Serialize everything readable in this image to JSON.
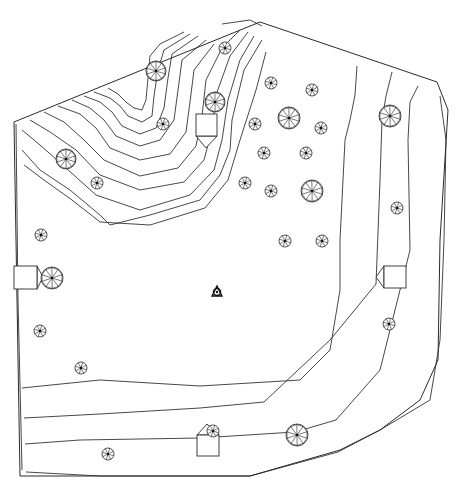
{
  "diagram": {
    "type": "site-plan-topographic",
    "width": 460,
    "height": 484,
    "colors": {
      "background": "#ffffff",
      "line": "#333333"
    },
    "boundary": [
      [
        14,
        122
      ],
      [
        260,
        22
      ],
      [
        437,
        82
      ],
      [
        448,
        110
      ],
      [
        440,
        240
      ],
      [
        438,
        360
      ],
      [
        420,
        400
      ],
      [
        380,
        430
      ],
      [
        340,
        450
      ],
      [
        250,
        476
      ],
      [
        20,
        476
      ]
    ],
    "contours": [
      [
        [
          16,
          124
        ],
        [
          18,
          300
        ],
        [
          22,
          470
        ]
      ],
      [
        [
          22,
          150
        ],
        [
          40,
          170
        ],
        [
          70,
          190
        ],
        [
          100,
          215
        ],
        [
          110,
          225
        ],
        [
          150,
          215
        ],
        [
          200,
          200
        ],
        [
          220,
          175
        ],
        [
          230,
          150
        ],
        [
          232,
          120
        ],
        [
          244,
          70
        ],
        [
          262,
          40
        ]
      ],
      [
        [
          24,
          165
        ],
        [
          44,
          180
        ],
        [
          72,
          200
        ],
        [
          100,
          222
        ],
        [
          150,
          225
        ],
        [
          205,
          208
        ],
        [
          228,
          180
        ],
        [
          240,
          140
        ],
        [
          256,
          90
        ],
        [
          266,
          52
        ]
      ],
      [
        [
          22,
          130
        ],
        [
          40,
          145
        ],
        [
          66,
          168
        ],
        [
          96,
          195
        ],
        [
          140,
          210
        ],
        [
          190,
          195
        ],
        [
          214,
          170
        ],
        [
          222,
          140
        ],
        [
          228,
          100
        ],
        [
          240,
          60
        ],
        [
          254,
          36
        ]
      ],
      [
        [
          30,
          120
        ],
        [
          50,
          132
        ],
        [
          76,
          150
        ],
        [
          100,
          175
        ],
        [
          140,
          190
        ],
        [
          184,
          182
        ],
        [
          204,
          160
        ],
        [
          212,
          130
        ],
        [
          216,
          95
        ],
        [
          230,
          56
        ],
        [
          248,
          32
        ]
      ],
      [
        [
          44,
          112
        ],
        [
          64,
          122
        ],
        [
          84,
          140
        ],
        [
          104,
          160
        ],
        [
          140,
          176
        ],
        [
          178,
          168
        ],
        [
          196,
          146
        ],
        [
          202,
          116
        ],
        [
          206,
          80
        ],
        [
          222,
          48
        ],
        [
          240,
          30
        ]
      ],
      [
        [
          58,
          106
        ],
        [
          80,
          114
        ],
        [
          96,
          128
        ],
        [
          110,
          148
        ],
        [
          140,
          160
        ],
        [
          170,
          154
        ],
        [
          186,
          132
        ],
        [
          190,
          102
        ],
        [
          194,
          70
        ],
        [
          214,
          44
        ]
      ],
      [
        [
          72,
          100
        ],
        [
          90,
          108
        ],
        [
          104,
          120
        ],
        [
          116,
          136
        ],
        [
          140,
          146
        ],
        [
          160,
          140
        ],
        [
          174,
          120
        ],
        [
          178,
          90
        ],
        [
          182,
          60
        ],
        [
          206,
          40
        ]
      ],
      [
        [
          84,
          96
        ],
        [
          100,
          102
        ],
        [
          112,
          112
        ],
        [
          122,
          126
        ],
        [
          140,
          134
        ],
        [
          156,
          128
        ],
        [
          164,
          108
        ],
        [
          168,
          78
        ],
        [
          172,
          54
        ],
        [
          198,
          36
        ]
      ],
      [
        [
          94,
          92
        ],
        [
          110,
          98
        ],
        [
          120,
          106
        ],
        [
          128,
          116
        ],
        [
          142,
          122
        ],
        [
          152,
          116
        ],
        [
          154,
          96
        ],
        [
          158,
          70
        ],
        [
          164,
          50
        ],
        [
          190,
          34
        ]
      ],
      [
        [
          108,
          88
        ],
        [
          118,
          94
        ],
        [
          126,
          102
        ],
        [
          134,
          108
        ],
        [
          142,
          110
        ],
        [
          146,
          100
        ],
        [
          148,
          78
        ],
        [
          150,
          56
        ],
        [
          160,
          44
        ],
        [
          184,
          32
        ]
      ],
      [
        [
          222,
          24
        ],
        [
          250,
          20
        ],
        [
          262,
          26
        ]
      ],
      [
        [
          22,
          388
        ],
        [
          100,
          380
        ],
        [
          200,
          386
        ],
        [
          300,
          380
        ],
        [
          330,
          350
        ],
        [
          340,
          290
        ],
        [
          340,
          240
        ],
        [
          345,
          140
        ],
        [
          350,
          120
        ],
        [
          355,
          95
        ],
        [
          357,
          66
        ]
      ],
      [
        [
          24,
          418
        ],
        [
          100,
          414
        ],
        [
          200,
          408
        ],
        [
          264,
          402
        ],
        [
          330,
          340
        ],
        [
          376,
          284
        ],
        [
          380,
          180
        ],
        [
          382,
          120
        ],
        [
          386,
          96
        ],
        [
          392,
          72
        ]
      ],
      [
        [
          25,
          444
        ],
        [
          80,
          440
        ],
        [
          200,
          438
        ],
        [
          295,
          432
        ],
        [
          336,
          420
        ],
        [
          380,
          370
        ],
        [
          390,
          330
        ],
        [
          410,
          250
        ],
        [
          408,
          140
        ],
        [
          410,
          102
        ],
        [
          418,
          86
        ]
      ],
      [
        [
          26,
          472
        ],
        [
          100,
          476
        ],
        [
          250,
          476
        ],
        [
          338,
          452
        ],
        [
          380,
          430
        ],
        [
          430,
          400
        ],
        [
          440,
          340
        ],
        [
          444,
          240
        ],
        [
          446,
          140
        ],
        [
          440,
          96
        ]
      ]
    ],
    "trees": [
      {
        "x": 156,
        "y": 71,
        "r": 10,
        "spokes": 10,
        "kind": "large"
      },
      {
        "x": 225,
        "y": 48,
        "r": 6,
        "spokes": 8,
        "kind": "small"
      },
      {
        "x": 215,
        "y": 102,
        "r": 10,
        "spokes": 10,
        "kind": "large"
      },
      {
        "x": 163,
        "y": 124,
        "r": 6,
        "spokes": 8,
        "kind": "small"
      },
      {
        "x": 66,
        "y": 159,
        "r": 10,
        "spokes": 10,
        "kind": "large"
      },
      {
        "x": 97,
        "y": 183,
        "r": 6,
        "spokes": 8,
        "kind": "small"
      },
      {
        "x": 41,
        "y": 235,
        "r": 6,
        "spokes": 8,
        "kind": "small"
      },
      {
        "x": 271,
        "y": 83,
        "r": 6,
        "spokes": 8,
        "kind": "small"
      },
      {
        "x": 312,
        "y": 90,
        "r": 6,
        "spokes": 8,
        "kind": "small"
      },
      {
        "x": 289,
        "y": 118,
        "r": 11,
        "spokes": 10,
        "kind": "large"
      },
      {
        "x": 255,
        "y": 124,
        "r": 6,
        "spokes": 8,
        "kind": "small"
      },
      {
        "x": 321,
        "y": 128,
        "r": 6,
        "spokes": 8,
        "kind": "small"
      },
      {
        "x": 264,
        "y": 153,
        "r": 6,
        "spokes": 8,
        "kind": "small"
      },
      {
        "x": 306,
        "y": 153,
        "r": 6,
        "spokes": 8,
        "kind": "small"
      },
      {
        "x": 245,
        "y": 183,
        "r": 6,
        "spokes": 8,
        "kind": "small"
      },
      {
        "x": 271,
        "y": 191,
        "r": 6,
        "spokes": 8,
        "kind": "small"
      },
      {
        "x": 312,
        "y": 191,
        "r": 11,
        "spokes": 10,
        "kind": "large"
      },
      {
        "x": 390,
        "y": 116,
        "r": 11,
        "spokes": 10,
        "kind": "large"
      },
      {
        "x": 397,
        "y": 208,
        "r": 6,
        "spokes": 8,
        "kind": "small"
      },
      {
        "x": 285,
        "y": 241,
        "r": 6,
        "spokes": 8,
        "kind": "small"
      },
      {
        "x": 322,
        "y": 241,
        "r": 6,
        "spokes": 8,
        "kind": "small"
      },
      {
        "x": 52,
        "y": 278,
        "r": 11,
        "spokes": 10,
        "kind": "large"
      },
      {
        "x": 40,
        "y": 331,
        "r": 6,
        "spokes": 8,
        "kind": "small"
      },
      {
        "x": 81,
        "y": 368,
        "r": 6,
        "spokes": 8,
        "kind": "small"
      },
      {
        "x": 389,
        "y": 324,
        "r": 6,
        "spokes": 8,
        "kind": "small"
      },
      {
        "x": 213,
        "y": 431,
        "r": 6,
        "spokes": 8,
        "kind": "small"
      },
      {
        "x": 297,
        "y": 435,
        "r": 11,
        "spokes": 10,
        "kind": "large"
      },
      {
        "x": 108,
        "y": 454,
        "r": 6,
        "spokes": 8,
        "kind": "small"
      }
    ],
    "structures": [
      {
        "name": "structure-top-center",
        "rect": [
          196,
          114,
          21,
          22
        ],
        "arrow": [
          [
            196,
            136
          ],
          [
            206,
            148
          ],
          [
            217,
            136
          ]
        ]
      },
      {
        "name": "structure-left",
        "rect": [
          14,
          266,
          23,
          23
        ],
        "arrow": [
          [
            37,
            266
          ],
          [
            43,
            277
          ],
          [
            37,
            289
          ]
        ]
      },
      {
        "name": "structure-right",
        "rect": [
          384,
          266,
          22,
          22
        ],
        "arrow": [
          [
            384,
            266
          ],
          [
            376,
            277
          ],
          [
            384,
            288
          ]
        ]
      },
      {
        "name": "structure-bottom",
        "rect": [
          197,
          435,
          22,
          21
        ],
        "arrow": [
          [
            197,
            435
          ],
          [
            207,
            424
          ],
          [
            219,
            435
          ]
        ]
      }
    ],
    "center_marker": {
      "x": 217,
      "y": 292,
      "label": "survey-point"
    }
  }
}
